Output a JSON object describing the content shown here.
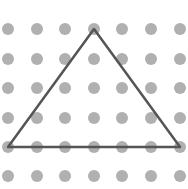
{
  "diagram": {
    "type": "dot-grid-geometry",
    "shape": "triangle",
    "grid": {
      "columns_x": [
        8,
        37,
        65,
        94,
        122,
        151,
        180
      ],
      "rows_y": [
        29,
        59,
        88,
        118,
        147,
        176
      ],
      "dot_radius": 6,
      "dot_color": "#b0b0b0"
    },
    "triangle": {
      "vertices": [
        [
          94,
          29
        ],
        [
          8,
          147
        ],
        [
          180,
          147
        ]
      ],
      "stroke_color": "#555555",
      "stroke_width": 2.5
    }
  }
}
